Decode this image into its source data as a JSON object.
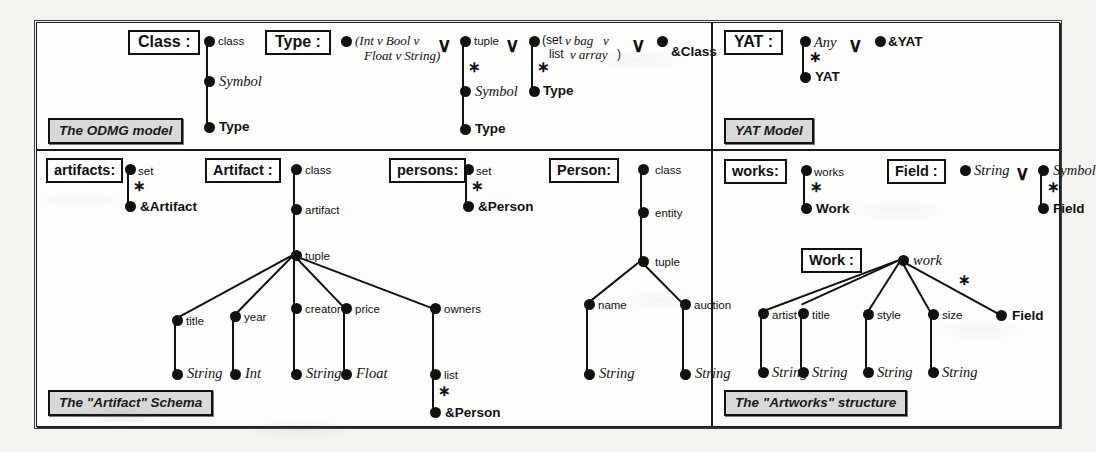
{
  "figure": {
    "panels": [
      {
        "id": "odmg",
        "caption": "The ODMG model",
        "type_names": [
          "Class :",
          "Type :"
        ]
      },
      {
        "id": "yat",
        "caption": "YAT Model",
        "type_names": [
          "YAT :"
        ]
      },
      {
        "id": "artifact",
        "caption": "The \"Artifact\" Schema",
        "type_names": [
          "artifacts:",
          "Artifact :",
          "persons:",
          "Person:"
        ]
      },
      {
        "id": "artworks",
        "caption": "The \"Artworks\" structure",
        "type_names": [
          "works:",
          "Field :",
          "Work :"
        ]
      }
    ]
  },
  "labels": {
    "class": "class",
    "symbol": "Symbol",
    "type": "Type",
    "tuple": "tuple",
    "set": "set",
    "star": "∗",
    "vee": "∨",
    "and_class": "&Class",
    "any": "Any",
    "and_yat": "&YAT",
    "yat": "YAT",
    "artifact": "artifact",
    "and_artifact": "&Artifact",
    "and_person": "&Person",
    "title": "title",
    "year": "year",
    "creator": "creator",
    "price": "price",
    "owners": "owners",
    "list": "list",
    "string": "String",
    "int": "Int",
    "float": "Float",
    "entity": "entity",
    "name": "name",
    "auction": "auction",
    "works": "works",
    "work_bold": "Work",
    "work_it": "work",
    "field_bold": "Field",
    "artist": "artist",
    "style": "style",
    "size": "size",
    "union_prim_l1": "(Int ᴠ Bool ᴠ",
    "union_prim_l2": "Float ᴠ String)",
    "union_coll_l1a": "(set",
    "union_coll_l1b": "ᴠ bag",
    "union_coll_l1c": "ᴠ",
    "union_coll_l2a": "list",
    "union_coll_l2b": "ᴠ array",
    "union_coll_l2c": ")"
  },
  "colors": {
    "ink": "#111111",
    "paper": "#fdfdfc",
    "page": "#f5f4f1",
    "caption_fill": "#d9d9d9"
  }
}
